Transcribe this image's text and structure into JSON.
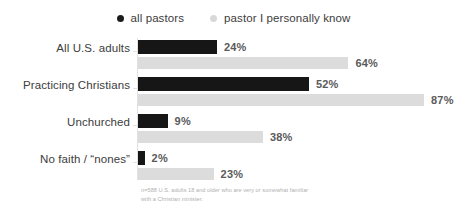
{
  "legend": {
    "items": [
      {
        "label": "all pastors",
        "marker": "dot-icon",
        "color": "#1c1c1c",
        "key": "all_pastors"
      },
      {
        "label": "pastor I personally know",
        "marker": "dot-icon",
        "color": "#d9d9d9",
        "key": "known_pastor"
      }
    ]
  },
  "footnote": {
    "line1": "n=588 U.S. adults 18 and older who are very or somewhat familiar",
    "line2": "with a Christian minister."
  },
  "chart_data": {
    "type": "bar",
    "orientation": "horizontal",
    "title": "",
    "xlabel": "",
    "ylabel": "",
    "xlim": [
      0,
      100
    ],
    "grid": false,
    "legend_position": "top-center",
    "value_suffix": "%",
    "categories": [
      "All U.S. adults",
      "Practicing Christians",
      "Unchurched",
      "No faith / “nones”"
    ],
    "series": [
      {
        "name": "all pastors",
        "color": "#161616",
        "values": [
          24,
          52,
          9,
          2
        ],
        "labels": [
          "24%",
          "52%",
          "9%",
          "2%"
        ]
      },
      {
        "name": "pastor I personally know",
        "color": "#dcdcdc",
        "values": [
          64,
          87,
          38,
          23
        ],
        "labels": [
          "64%",
          "87%",
          "38%",
          "23%"
        ]
      }
    ]
  }
}
